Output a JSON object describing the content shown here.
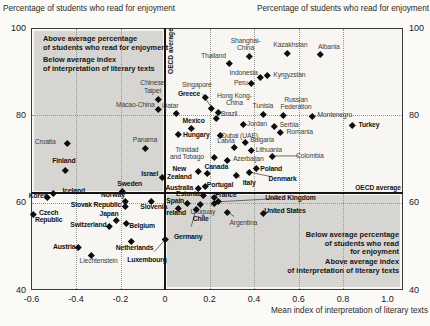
{
  "chart_data": {
    "type": "scatter",
    "title_left": "Percentage of students who read for enjoyment",
    "title_right": "Percentage of students who read for enjoyment",
    "xlabel": "Mean index of interpretation of literary texts",
    "xlim": [
      -0.6,
      1.0
    ],
    "ylim": [
      40,
      100
    ],
    "x_ticks": [
      "-0.6",
      "-0.4",
      "-0.2",
      "0",
      "0.2",
      "0.4",
      "0.6",
      "0.8",
      "1.0"
    ],
    "y_ticks": [
      100,
      80,
      60,
      40
    ],
    "grid": "dotted",
    "legend_position": "none",
    "marker": "diamond",
    "oecd_average": {
      "x": 0,
      "y": 62.2,
      "vertical_label": "OECD average",
      "horizontal_label": "OECD average"
    },
    "quadrant_labels": {
      "top_left_1": "Above average percentage\nof students who read for enjoyment",
      "top_left_2": "Below average index\nof interpretation of literary texts",
      "bottom_right_1": "Below average percentage\nof students who read\nfor enjoyment",
      "bottom_right_2": "Above average index\nof interpretation of literary texts"
    },
    "points": [
      {
        "label": "Chinese\nTaipei",
        "x": -0.03,
        "y": 83.7,
        "oecd": false,
        "dx": -6,
        "dy": -13
      },
      {
        "label": "Macao-China",
        "x": -0.03,
        "y": 81.4,
        "oecd": false,
        "dx": -23,
        "dy": -4
      },
      {
        "label": "Croatia",
        "x": -0.44,
        "y": 73.7,
        "oecd": false,
        "dx": -22,
        "dy": -1
      },
      {
        "label": "Finland",
        "x": -0.45,
        "y": 67.5,
        "oecd": true,
        "dx": -1,
        "dy": -9
      },
      {
        "label": "Panama",
        "x": -0.09,
        "y": 72.5,
        "oecd": false,
        "dx": 0,
        "dy": -8
      },
      {
        "label": "Israel",
        "x": -0.01,
        "y": 65.9,
        "oecd": true,
        "dx": -13,
        "dy": -3
      },
      {
        "label": "Sweden",
        "x": -0.19,
        "y": 62.7,
        "oecd": true,
        "dx": 7,
        "dy": -7
      },
      {
        "label": "Qatar",
        "x": 0.05,
        "y": 80.5,
        "oecd": false,
        "dx": -6,
        "dy": -7
      },
      {
        "label": "Iceland",
        "x": -0.5,
        "y": 62.2,
        "oecd": true,
        "dx": 20,
        "dy": -2
      },
      {
        "label": "Korea",
        "x": -0.53,
        "y": 61.3,
        "oecd": true,
        "dx": -9,
        "dy": -1
      },
      {
        "label": "Norway",
        "x": -0.18,
        "y": 60.4,
        "oecd": true,
        "dx": -12,
        "dy": -6
      },
      {
        "label": "Slovak Republic",
        "x": -0.18,
        "y": 59.2,
        "oecd": true,
        "dx": -29,
        "dy": -1
      },
      {
        "label": "Slovenia",
        "x": -0.06,
        "y": 60.4,
        "oecd": true,
        "dx": 2,
        "dy": 6
      },
      {
        "label": "Czech\nRepublic",
        "x": -0.59,
        "y": 57.4,
        "oecd": true,
        "dx": 15,
        "dy": 2
      },
      {
        "label": "Japan",
        "x": -0.22,
        "y": 56.0,
        "oecd": true,
        "dx": -7,
        "dy": -6
      },
      {
        "label": "Switzerland",
        "x": -0.25,
        "y": 54.7,
        "oecd": true,
        "dx": -21,
        "dy": -1
      },
      {
        "label": "Belgium",
        "x": -0.175,
        "y": 55.3,
        "oecd": true,
        "dx": 16,
        "dy": 3
      },
      {
        "label": "Austria",
        "x": -0.39,
        "y": 49.8,
        "oecd": true,
        "dx": -14,
        "dy": 0
      },
      {
        "label": "Netherlands",
        "x": -0.15,
        "y": 51.2,
        "oecd": true,
        "dx": 3,
        "dy": 7
      },
      {
        "label": "Liechtenstein",
        "x": -0.33,
        "y": 48.0,
        "oecd": false,
        "dx": 7,
        "dy": 6
      },
      {
        "label": "Luxembourg",
        "x": 0.0,
        "y": 51.5,
        "oecd": true,
        "dx": -18,
        "dy": 20,
        "leader": true
      },
      {
        "label": "Spain",
        "x": 0.1,
        "y": 59.9,
        "oecd": true,
        "dx": -12,
        "dy": -2
      },
      {
        "label": "Ireland",
        "x": 0.06,
        "y": 58.8,
        "oecd": true,
        "dx": -3,
        "dy": 5
      },
      {
        "label": "Estonia",
        "x": 0.17,
        "y": 61.8,
        "oecd": true,
        "dx": -15,
        "dy": -1
      },
      {
        "label": "France",
        "x": 0.22,
        "y": 61.3,
        "oecd": true,
        "dx": 12,
        "dy": -2
      },
      {
        "label": "United Kingdom",
        "x": 0.24,
        "y": 60.2,
        "oecd": true,
        "dx": 72,
        "dy": -4,
        "leader": true
      },
      {
        "label": "Uruguay",
        "x": 0.22,
        "y": 59.9,
        "oecd": false,
        "dx": -11,
        "dy": 9,
        "leader": true
      },
      {
        "label": "Chile",
        "x": 0.16,
        "y": 59.7,
        "oecd": true,
        "dx": 0,
        "dy": 15,
        "leader": true
      },
      {
        "label": "Germany",
        "x": 0.14,
        "y": 58.5,
        "oecd": true,
        "dx": -8,
        "dy": 28,
        "leader": true
      },
      {
        "label": "Argentina",
        "x": 0.28,
        "y": 57.9,
        "oecd": false,
        "dx": 16,
        "dy": 11,
        "leader": true
      },
      {
        "label": "United States",
        "x": 0.44,
        "y": 57.6,
        "oecd": true,
        "dx": 22,
        "dy": -2
      },
      {
        "label": "Greece",
        "x": 0.18,
        "y": 84.2,
        "oecd": true,
        "dx": -16,
        "dy": -3
      },
      {
        "label": "Singapore",
        "x": 0.21,
        "y": 81.7,
        "oecd": false,
        "dx": -15,
        "dy": -23,
        "leader": true
      },
      {
        "label": "Hong Kong-\nChina",
        "x": 0.24,
        "y": 80.8,
        "oecd": false,
        "dx": 16,
        "dy": -13
      },
      {
        "label": "Brazil",
        "x": 0.23,
        "y": 79.4,
        "oecd": false,
        "dx": 13,
        "dy": -4
      },
      {
        "label": "Mexico",
        "x": 0.12,
        "y": 77.1,
        "oecd": true,
        "dx": 2,
        "dy": -7
      },
      {
        "label": "Hungary",
        "x": 0.06,
        "y": 75.7,
        "oecd": true,
        "dx": 18,
        "dy": 1
      },
      {
        "label": "Thailand",
        "x": 0.29,
        "y": 92.0,
        "oecd": false,
        "dx": -16,
        "dy": -7
      },
      {
        "label": "Shanghai-\nChina",
        "x": 0.38,
        "y": 93.6,
        "oecd": false,
        "dx": -4,
        "dy": -12
      },
      {
        "label": "Kazakhstan",
        "x": 0.55,
        "y": 94.3,
        "oecd": false,
        "dx": 3,
        "dy": -8
      },
      {
        "label": "Albania",
        "x": 0.7,
        "y": 94.0,
        "oecd": false,
        "dx": 8,
        "dy": -7
      },
      {
        "label": "Indonesia",
        "x": 0.43,
        "y": 88.8,
        "oecd": false,
        "dx": -17,
        "dy": -4
      },
      {
        "label": "Kyrgyzstan",
        "x": 0.46,
        "y": 89.2,
        "oecd": false,
        "dx": 22,
        "dy": 0
      },
      {
        "label": "Peru",
        "x": 0.39,
        "y": 87.4,
        "oecd": false,
        "dx": -11,
        "dy": 0
      },
      {
        "label": "Tunisia",
        "x": 0.44,
        "y": 80.3,
        "oecd": false,
        "dx": 0,
        "dy": -8
      },
      {
        "label": "Russian\nFederation",
        "x": 0.53,
        "y": 80.1,
        "oecd": false,
        "dx": 13,
        "dy": -12
      },
      {
        "label": "Montenegro",
        "x": 0.66,
        "y": 79.8,
        "oecd": false,
        "dx": 23,
        "dy": -1
      },
      {
        "label": "Jordan",
        "x": 0.35,
        "y": 78.0,
        "oecd": false,
        "dx": 14,
        "dy": 0
      },
      {
        "label": "Serbia",
        "x": 0.49,
        "y": 77.6,
        "oecd": false,
        "dx": 15,
        "dy": -1
      },
      {
        "label": "Romania",
        "x": 0.52,
        "y": 76.2,
        "oecd": false,
        "dx": 19,
        "dy": 0
      },
      {
        "label": "Turkey",
        "x": 0.84,
        "y": 77.8,
        "oecd": true,
        "dx": 17,
        "dy": 0
      },
      {
        "label": "Dubai (UAE)",
        "x": 0.25,
        "y": 75.5,
        "oecd": false,
        "dx": 19,
        "dy": 1
      },
      {
        "label": "Latvia",
        "x": 0.31,
        "y": 72.7,
        "oecd": false,
        "dx": -8,
        "dy": -6
      },
      {
        "label": "Bulgaria",
        "x": 0.36,
        "y": 73.9,
        "oecd": false,
        "dx": 17,
        "dy": -2
      },
      {
        "label": "Lithuania",
        "x": 0.39,
        "y": 72.1,
        "oecd": false,
        "dx": 17,
        "dy": 0
      },
      {
        "label": "Azerbaijan",
        "x": 0.28,
        "y": 69.8,
        "oecd": false,
        "dx": 21,
        "dy": -1
      },
      {
        "label": "Colombia",
        "x": 0.48,
        "y": 70.7,
        "oecd": false,
        "dx": 38,
        "dy": 0,
        "leader": true
      },
      {
        "label": "Trinidad\nand Tobago",
        "x": 0.22,
        "y": 70.5,
        "oecd": false,
        "dx": -27,
        "dy": -4
      },
      {
        "label": "Canada",
        "x": 0.19,
        "y": 66.8,
        "oecd": true,
        "dx": 9,
        "dy": -6
      },
      {
        "label": "New\nZealand",
        "x": 0.15,
        "y": 67.2,
        "oecd": true,
        "dx": -19,
        "dy": 1
      },
      {
        "label": "Poland",
        "x": 0.41,
        "y": 67.9,
        "oecd": true,
        "dx": 15,
        "dy": 1
      },
      {
        "label": "Denmark",
        "x": 0.38,
        "y": 67.0,
        "oecd": true,
        "dx": 33,
        "dy": 7,
        "leader": true
      },
      {
        "label": "Italy",
        "x": 0.32,
        "y": 66.3,
        "oecd": true,
        "dx": 13,
        "dy": 8,
        "leader": true
      },
      {
        "label": "Portugal",
        "x": 0.18,
        "y": 63.8,
        "oecd": true,
        "dx": 15,
        "dy": -1
      },
      {
        "label": "Australia",
        "x": 0.15,
        "y": 63.4,
        "oecd": true,
        "dx": -19,
        "dy": 0
      }
    ]
  }
}
